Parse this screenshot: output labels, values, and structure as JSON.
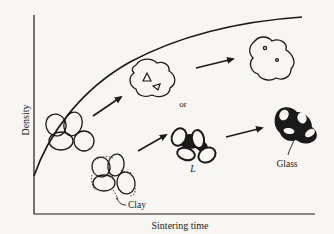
{
  "figure": {
    "type": "densification-vs-sintering-time schematic",
    "axes": {
      "xlabel": "Sintering time",
      "ylabel": "Density"
    },
    "labels": {
      "or": "or",
      "clay": "Clay",
      "liquid": "L",
      "glass": "Glass"
    },
    "stages": {
      "solid_state": [
        "initial particle compact",
        "particles with isolated pores",
        "dense grain with small closed pores"
      ],
      "liquid_phase": [
        "compact with clay between particles",
        "particles with liquid phase L",
        "particles bonded by glass"
      ]
    },
    "colors": {
      "ink": "#1a1a1a",
      "background": "#f7f6f3"
    }
  }
}
